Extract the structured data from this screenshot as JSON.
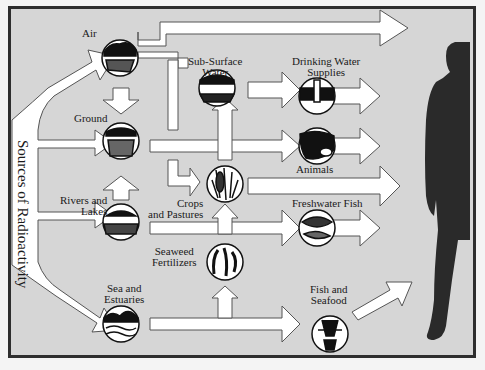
{
  "title": "Sources of Radioactivity",
  "sources": [
    {
      "id": "air",
      "label": "Air"
    },
    {
      "id": "ground",
      "label": "Ground"
    },
    {
      "id": "rivers",
      "label": "Rivers and Lakes",
      "line1": "Rivers and",
      "line2": "Lakes"
    },
    {
      "id": "sea",
      "label": "Sea and Estuaries",
      "line1": "Sea and",
      "line2": "Estuaries"
    }
  ],
  "intermediates": [
    {
      "id": "subsurface",
      "label": "Sub-Surface Water",
      "line1": "Sub-Surface",
      "line2": "Water"
    },
    {
      "id": "crops",
      "label": "Crops and Pastures",
      "line1": "Crops",
      "line2": "and Pastures"
    },
    {
      "id": "seaweed",
      "label": "Seaweed Fertilizers",
      "line1": "Seaweed",
      "line2": "Fertilizers"
    }
  ],
  "pathways": [
    {
      "id": "drinking",
      "label": "Drinking Water Supplies",
      "line1": "Drinking Water",
      "line2": "Supplies"
    },
    {
      "id": "animals",
      "label": "Animals"
    },
    {
      "id": "freshwater",
      "label": "Freshwater Fish"
    },
    {
      "id": "seafood",
      "label": "Fish and Seafood",
      "line1": "Fish and",
      "line2": "Seafood"
    }
  ],
  "target": {
    "label": "Human"
  },
  "colors": {
    "background": "#d6d6d6",
    "border": "#2e2e2e",
    "arrow_fill": "#ffffff",
    "arrow_stroke": "#444444",
    "silhouette": "#2a2a2a"
  }
}
